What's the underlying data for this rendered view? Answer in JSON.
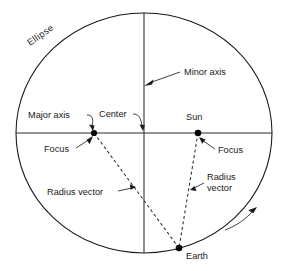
{
  "diagram": {
    "labels": {
      "ellipse": "Ellipse",
      "minor_axis": "Minor axis",
      "major_axis": "Major axis",
      "center": "Center",
      "sun": "Sun",
      "focus_left": "Focus",
      "focus_right": "Focus",
      "radius_vector_left": "Radius vector",
      "radius_vector_right_line1": "Radius",
      "radius_vector_right_line2": "vector",
      "earth": "Earth"
    },
    "colors": {
      "stroke": "#1a1a1a",
      "axis": "#2b2b2b",
      "dot": "#000000",
      "background": "#ffffff"
    },
    "geometry": {
      "ellipse_center_x": 144,
      "ellipse_center_y": 133,
      "ellipse_radius_x": 128,
      "ellipse_radius_y": 120,
      "focus_left_x": 94,
      "focus_left_y": 133,
      "focus_right_x": 198,
      "focus_right_y": 133,
      "earth_x": 179,
      "earth_y": 248
    }
  }
}
